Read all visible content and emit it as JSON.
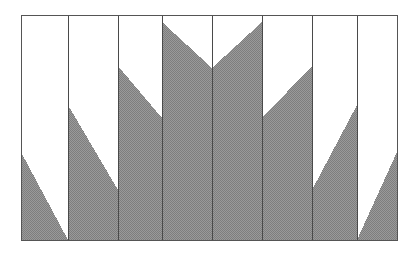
{
  "figure": {
    "title": "",
    "canvas": {
      "width": 417,
      "height": 256
    },
    "colors": {
      "background": "#ffffff",
      "fill": "#8c8c8c",
      "fill_pattern_light": "#b4b4b4",
      "fill_pattern_dark": "#6e6e6e",
      "border": "#555555",
      "gridline": "#4a4a4a"
    },
    "plot_area": {
      "x0": 21,
      "y0": 15,
      "x1": 397,
      "y1": 240
    }
  },
  "chart_data": {
    "type": "area",
    "title": "",
    "subtitle": "",
    "xlabel": "",
    "ylabel": "",
    "grid": true,
    "legend": null,
    "legend_position": "none",
    "orientation": "vertical",
    "note": "Eight adjacent columns separated by vertical gridlines. Each column is filled from its slanted top edge down to the baseline, producing a zigzag / sawtooth silhouette.",
    "baseline_y": 240,
    "top_y": 15,
    "axis_x_range": [
      21,
      397
    ],
    "axis_y_range": [
      15,
      240
    ],
    "column_edges": [
      21,
      68,
      118,
      162,
      212,
      262,
      312,
      357,
      397
    ],
    "categories": [
      "1",
      "2",
      "3",
      "4",
      "5",
      "6",
      "7",
      "8"
    ],
    "columns": [
      {
        "index": 1,
        "x_left": 21,
        "x_right": 68,
        "y_left": 152,
        "y_right": 240,
        "slope": "down",
        "peak_side": "left"
      },
      {
        "index": 2,
        "x_left": 68,
        "x_right": 118,
        "y_left": 105,
        "y_right": 190,
        "slope": "down",
        "peak_side": "left"
      },
      {
        "index": 3,
        "x_left": 118,
        "x_right": 162,
        "y_left": 66,
        "y_right": 118,
        "slope": "down",
        "peak_side": "left"
      },
      {
        "index": 4,
        "x_left": 162,
        "x_right": 212,
        "y_left": 22,
        "y_right": 68,
        "slope": "down",
        "peak_side": "left"
      },
      {
        "index": 5,
        "x_left": 212,
        "x_right": 262,
        "y_left": 68,
        "y_right": 22,
        "slope": "up",
        "peak_side": "right"
      },
      {
        "index": 6,
        "x_left": 262,
        "x_right": 312,
        "y_left": 118,
        "y_right": 66,
        "slope": "up",
        "peak_side": "right"
      },
      {
        "index": 7,
        "x_left": 312,
        "x_right": 357,
        "y_left": 190,
        "y_right": 105,
        "slope": "up",
        "peak_side": "right"
      },
      {
        "index": 8,
        "x_left": 357,
        "x_right": 397,
        "y_left": 240,
        "y_right": 152,
        "slope": "up",
        "peak_side": "right"
      }
    ],
    "values_left_height": [
      88,
      135,
      174,
      218,
      172,
      122,
      50,
      0
    ],
    "values_right_height": [
      0,
      50,
      122,
      172,
      218,
      174,
      135,
      88
    ],
    "gridlines_x": [
      68,
      118,
      162,
      212,
      262,
      312,
      357
    ]
  }
}
